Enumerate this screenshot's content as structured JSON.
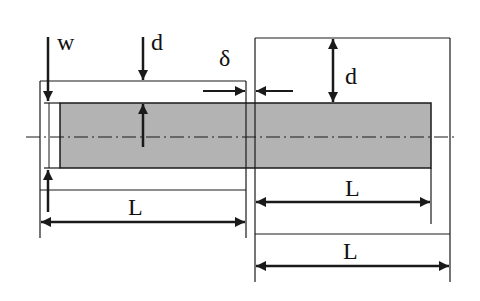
{
  "diagram": {
    "labels": {
      "w": "w",
      "d_left": "d",
      "delta": "δ",
      "d_right": "d",
      "L_left": "L",
      "L_right_inner": "L",
      "L_right_outer": "L"
    },
    "colors": {
      "line": "#1a1a1a",
      "fill": "#b3b3b3",
      "background": "#ffffff"
    }
  }
}
